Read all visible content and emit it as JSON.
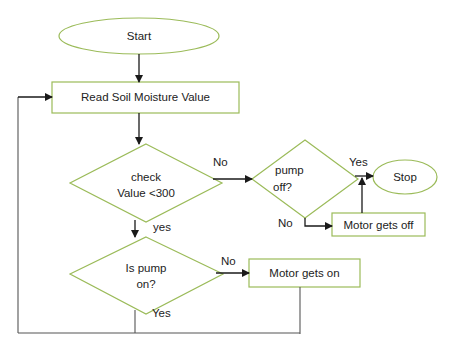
{
  "colors": {
    "shape_border": "#9bbb59",
    "connector": "#1a1a1a",
    "loop_line": "#555555",
    "text": "#222222",
    "background": "#ffffff"
  },
  "nodes": {
    "start": {
      "type": "terminator",
      "label": "Start"
    },
    "read": {
      "type": "process",
      "label": "Read Soil Moisture Value"
    },
    "check": {
      "type": "decision",
      "line1": "check",
      "line2": "Value <300"
    },
    "pump_off": {
      "type": "decision",
      "line1": "pump",
      "line2": "off?"
    },
    "stop": {
      "type": "terminator",
      "label": "Stop"
    },
    "motor_off": {
      "type": "process",
      "label": "Motor gets off"
    },
    "pump_on": {
      "type": "decision",
      "line1": "Is pump",
      "line2": "on?"
    },
    "motor_on": {
      "type": "process",
      "label": "Motor gets on"
    }
  },
  "edges": {
    "check_no": "No",
    "check_yes": "yes",
    "pump_off_yes": "Yes",
    "pump_off_no": "No",
    "pump_on_no": "No",
    "pump_on_yes": "Yes"
  }
}
